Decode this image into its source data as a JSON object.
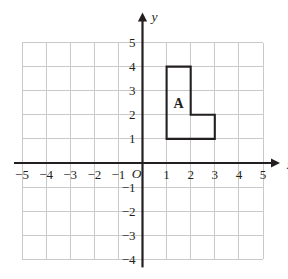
{
  "diagram": {
    "axes": {
      "x_name": "x",
      "y_name": "y",
      "origin_label": "O",
      "x_min": -5,
      "x_max": 5,
      "y_min": -4,
      "y_max": 5,
      "x_tick_labels": [
        "−5",
        "−4",
        "−3",
        "−2",
        "−1",
        "1",
        "2",
        "3",
        "4",
        "5"
      ],
      "x_tick_values": [
        -5,
        -4,
        -3,
        -2,
        -1,
        1,
        2,
        3,
        4,
        5
      ],
      "y_tick_labels": [
        "5",
        "4",
        "3",
        "2",
        "1",
        "−1",
        "−2",
        "−3",
        "−4"
      ],
      "y_tick_values": [
        5,
        4,
        3,
        2,
        1,
        -1,
        -2,
        -3,
        -4
      ],
      "grid": true,
      "grid_step": 1
    },
    "shapes": [
      {
        "label": "A",
        "label_position": {
          "x": 1.5,
          "y": 2.5
        },
        "vertices": [
          {
            "x": 1,
            "y": 1
          },
          {
            "x": 1,
            "y": 4
          },
          {
            "x": 2,
            "y": 4
          },
          {
            "x": 2,
            "y": 2
          },
          {
            "x": 3,
            "y": 2
          },
          {
            "x": 3,
            "y": 1
          }
        ],
        "closed": true
      }
    ],
    "colors": {
      "gridline": "#c9c9c9",
      "axis": "#231f20",
      "shape_stroke": "#231f20",
      "background": "#ffffff"
    }
  }
}
